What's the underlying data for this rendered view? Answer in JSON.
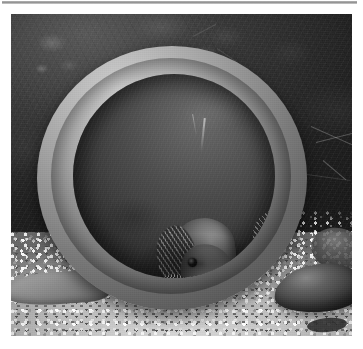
{
  "document": {
    "separator_rule": "horizontal-rule",
    "background_color": "#ffffff"
  },
  "figure": {
    "name": "aquarium-photograph",
    "rendering": "grayscale photograph",
    "caption": "",
    "palette": {
      "background_dark": "#232322",
      "pipe_light": "#cfc9bd",
      "pipe_mid": "#8e887c",
      "pipe_shadow": "#544f46",
      "cavity_dark": "#201f1c",
      "fish_body": "#7d786e",
      "gravel_light": "#f4f2ea",
      "gravel_mid": "#bcb8ac",
      "rock_dark": "#2e2c2a",
      "rule_gray": "#8f8f8f"
    },
    "scene": {
      "subject": "ceramic-pipe-with-fish",
      "environment": "aquarium",
      "substrate": "light gravel",
      "background": "dark mottled rear wall"
    },
    "elements": {
      "pipe_label": "ceramic pipe",
      "cavity_label": "pipe interior",
      "rim_label": "pipe rim highlight",
      "gravel_label": "gravel substrate",
      "rock_label": "smooth dark rock",
      "slab_label": "flat stone slab",
      "backdrop_label": "aquarium back wall"
    },
    "fish": [
      {
        "id": "fish-front",
        "label": "front cichlid facing viewer",
        "features": "dark eye, rayed pectoral fin"
      },
      {
        "id": "fish-right",
        "label": "right cichlid with spotted caudal fin",
        "features": "reticulated tail pattern"
      },
      {
        "id": "fish-bottom",
        "label": "bottom cichlid lying horizontally",
        "features": "visible eye, barred tail"
      }
    ]
  }
}
